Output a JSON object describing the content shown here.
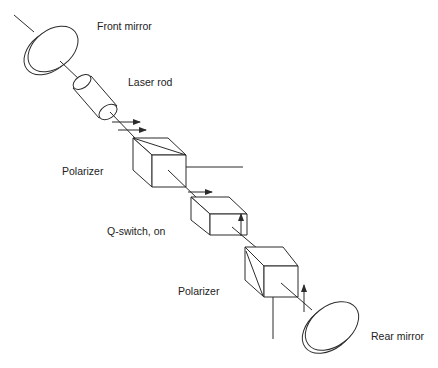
{
  "diagram": {
    "labels": {
      "front_mirror": "Front mirror",
      "laser_rod": "Laser rod",
      "polarizer_1": "Polarizer",
      "q_switch": "Q-switch, on",
      "polarizer_2": "Polarizer",
      "rear_mirror": "Rear mirror"
    },
    "components": [
      {
        "id": "front-mirror",
        "type": "mirror"
      },
      {
        "id": "laser-rod",
        "type": "cylinder"
      },
      {
        "id": "polarizer-1",
        "type": "polarizing-cube",
        "output": "horizontal-reject-beam"
      },
      {
        "id": "q-switch",
        "type": "cube",
        "state": "on"
      },
      {
        "id": "polarizer-2",
        "type": "polarizing-cube",
        "output": "vertical-reject-beam"
      },
      {
        "id": "rear-mirror",
        "type": "mirror"
      }
    ],
    "polarization_arrows": [
      {
        "location": "after-laser-rod",
        "direction": "horizontal",
        "count": 2
      },
      {
        "location": "after-polarizer-1",
        "direction": "horizontal",
        "count": 1
      },
      {
        "location": "after-q-switch",
        "direction": "vertical",
        "count": 1
      },
      {
        "location": "before-rear-mirror",
        "direction": "vertical",
        "count": 1
      }
    ],
    "colors": {
      "line": "#2b2b2b",
      "background": "#ffffff",
      "text": "#222222"
    }
  }
}
